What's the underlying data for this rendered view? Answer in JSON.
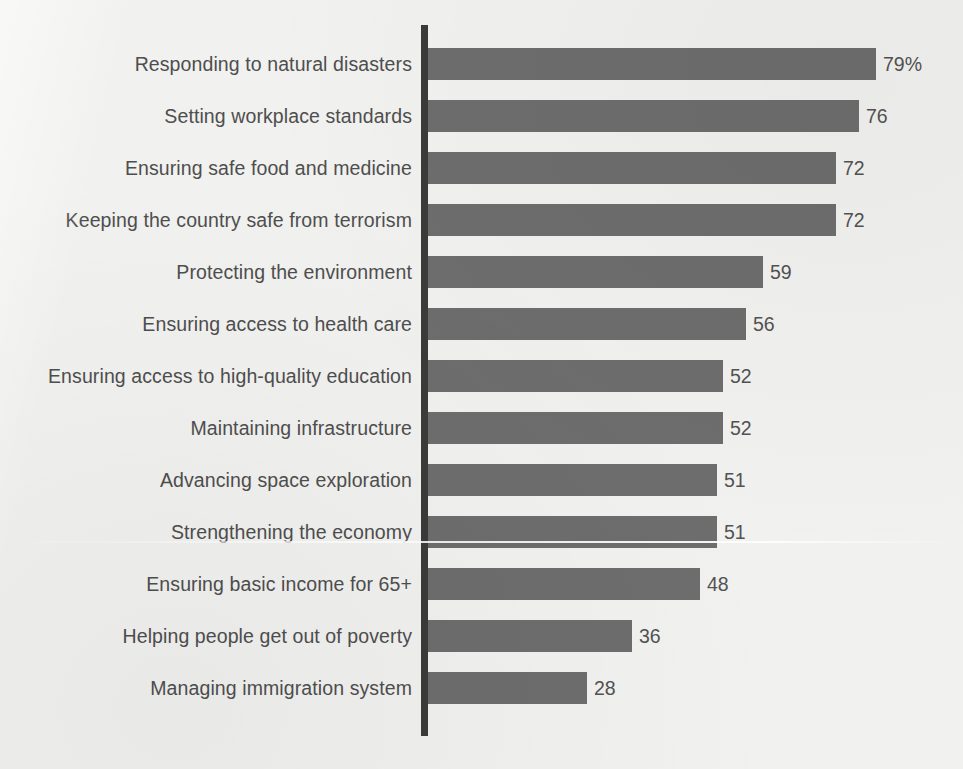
{
  "chart_data": {
    "type": "bar",
    "orientation": "horizontal",
    "title": "",
    "subtitle": "",
    "xlabel": "",
    "ylabel": "",
    "grid": false,
    "legend": null,
    "axis_line": "vertical-left-baseline",
    "value_suffix_first": "%",
    "xlim": [
      0,
      79
    ],
    "categories": [
      "Responding to natural disasters",
      "Setting workplace standards",
      "Ensuring safe food and medicine",
      "Keeping the country safe from terrorism",
      "Protecting the environment",
      "Ensuring access to health care",
      "Ensuring access to high-quality education",
      "Maintaining infrastructure",
      "Advancing space exploration",
      "Strengthening the economy",
      "Ensuring basic income for 65+",
      "Helping people get out of poverty",
      "Managing immigration system"
    ],
    "values": [
      79,
      76,
      72,
      72,
      59,
      56,
      52,
      52,
      51,
      51,
      48,
      36,
      28
    ],
    "value_labels": [
      "79%",
      "76",
      "72",
      "72",
      "59",
      "56",
      "52",
      "52",
      "51",
      "51",
      "48",
      "36",
      "28"
    ]
  },
  "colors": {
    "background": "#f1f1ef",
    "bar": "#6d6d6d",
    "axis": "#3b3b3b",
    "category_text": "#4e4e4e",
    "value_text": "#525252"
  }
}
